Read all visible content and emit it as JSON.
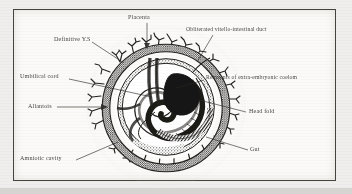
{
  "figure": {
    "caption": "",
    "frame": {
      "border_color": "#46443f",
      "background": "#fbfaf8"
    },
    "page_background": "#d8d8d6",
    "ink_color": "#22211e"
  },
  "labels": [
    {
      "id": "placenta",
      "text": "Placenta",
      "x": 128,
      "y": 17,
      "leader": "down"
    },
    {
      "id": "definitive-ys",
      "text": "Definitive Y.S",
      "x": 54,
      "y": 39,
      "leader": "diag-down-right"
    },
    {
      "id": "obliterated-vid",
      "text": "Obliterated vitello-intestinal duct",
      "x": 188,
      "y": 30,
      "leader": "diag-down-left"
    },
    {
      "id": "umbilical-cord",
      "text": "Umbilical cord",
      "x": 22,
      "y": 76,
      "leader": "right"
    },
    {
      "id": "remnants-coelom",
      "text": "Remnants of extra-embryonic coelom",
      "x": 205,
      "y": 77,
      "leader": "left"
    },
    {
      "id": "allantois",
      "text": "Allantois",
      "x": 30,
      "y": 105,
      "leader": "right-arrow"
    },
    {
      "id": "head-fold",
      "text": "Head fold",
      "x": 248,
      "y": 110,
      "leader": "left"
    },
    {
      "id": "amniotic-cavity",
      "text": "Amniotic cavity",
      "x": 22,
      "y": 157,
      "leader": "diag-up-right"
    },
    {
      "id": "gut",
      "text": "Gut",
      "x": 250,
      "y": 148,
      "leader": "left"
    }
  ],
  "structures": [
    {
      "id": "chorionic-villi",
      "name": "chorionic villi (placental villi)"
    },
    {
      "id": "chorion-ring",
      "name": "chorion / outer membrane ring"
    },
    {
      "id": "amnion-ring",
      "name": "amnion ring"
    },
    {
      "id": "yolk-sac-spiral",
      "name": "definitive yolk sac spiral"
    },
    {
      "id": "embryo-body",
      "name": "coiled embryo body"
    },
    {
      "id": "head-fold-mass",
      "name": "head fold (dark mass)"
    },
    {
      "id": "gut-tube",
      "name": "gut tube"
    },
    {
      "id": "umbilical-stalk",
      "name": "umbilical cord / connecting stalk"
    }
  ]
}
